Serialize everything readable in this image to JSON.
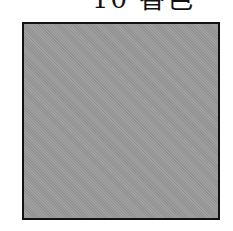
{
  "caption": {
    "text": "10 香色"
  },
  "swatch": {
    "fill_color": "#9a9a9a",
    "border_color": "#111111"
  }
}
